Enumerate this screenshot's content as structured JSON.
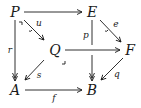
{
  "diagram": {
    "type": "commutative-diagram",
    "nodes": {
      "P": {
        "label": "P",
        "x": 15,
        "y": 12
      },
      "E": {
        "label": "E",
        "x": 92,
        "y": 12
      },
      "Q": {
        "label": "Q",
        "x": 55,
        "y": 50
      },
      "F": {
        "label": "F",
        "x": 130,
        "y": 50
      },
      "A": {
        "label": "A",
        "x": 15,
        "y": 90
      },
      "B": {
        "label": "B",
        "x": 92,
        "y": 90
      }
    },
    "edges": [
      {
        "id": "PE",
        "from": "P",
        "to": "E",
        "label": "",
        "style": "plain"
      },
      {
        "id": "u",
        "from": "P",
        "to": "Q",
        "label": "u",
        "style": "mono"
      },
      {
        "id": "r",
        "from": "P",
        "to": "A",
        "label": "r",
        "style": "epi"
      },
      {
        "id": "e",
        "from": "E",
        "to": "F",
        "label": "e",
        "style": "mono"
      },
      {
        "id": "p",
        "from": "E",
        "to": "B",
        "label": "p",
        "style": "epi"
      },
      {
        "id": "QF",
        "from": "Q",
        "to": "F",
        "label": "",
        "style": "plain"
      },
      {
        "id": "s",
        "from": "Q",
        "to": "A",
        "label": "s",
        "style": "plain"
      },
      {
        "id": "q",
        "from": "F",
        "to": "B",
        "label": "q",
        "style": "plain"
      },
      {
        "id": "f",
        "from": "A",
        "to": "B",
        "label": "f",
        "style": "plain"
      }
    ],
    "labels": {
      "u": "u",
      "r": "r",
      "e": "e",
      "p": "p",
      "s": "s",
      "q": "q",
      "f": "f"
    },
    "pullback_markers": [
      {
        "at": "P",
        "x": 20,
        "y": 25
      },
      {
        "at": "Q",
        "x": 64,
        "y": 62
      }
    ],
    "colors": {
      "ink": "#1a1a1a",
      "background": "#ffffff"
    }
  }
}
